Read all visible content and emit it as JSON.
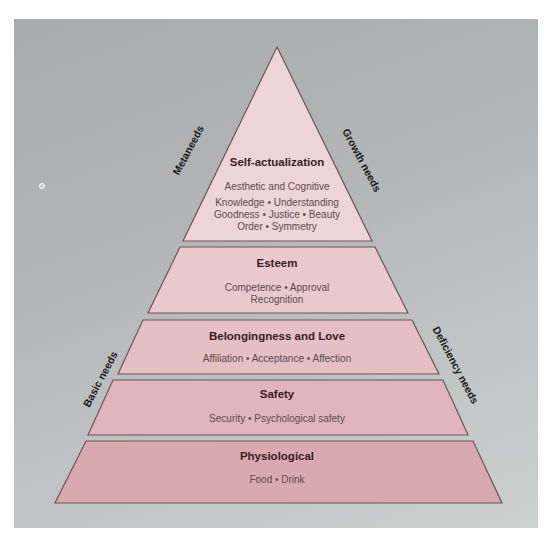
{
  "diagram": {
    "colors": {
      "background_panel": "#b3b5b6",
      "layer_fill": "#e4bfc4",
      "layer_stroke": "#6b5558",
      "title_text": "#3a1c24",
      "sub_text": "#5e4b4f"
    },
    "levels": [
      {
        "title": "Self-actualization",
        "lines": [
          "Aesthetic and Cognitive",
          "Knowledge • Understanding",
          "Goodness • Justice • Beauty",
          "Order • Symmetry"
        ]
      },
      {
        "title": "Esteem",
        "lines": [
          "Competence • Approval",
          "Recognition"
        ]
      },
      {
        "title": "Belongingness and Love",
        "lines": [
          "Affiliation • Acceptance • Affection"
        ]
      },
      {
        "title": "Safety",
        "lines": [
          "Security • Psychological safety"
        ]
      },
      {
        "title": "Physiological",
        "lines": [
          "Food • Drink"
        ]
      }
    ],
    "side_labels": {
      "upper_left": "Metaneeds",
      "upper_right": "Growth needs",
      "lower_left": "Basic needs",
      "lower_right": "Deficiency needs"
    }
  }
}
